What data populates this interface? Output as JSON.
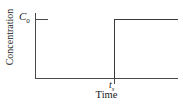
{
  "chart_data": {
    "type": "line",
    "title": "",
    "subtitle": "",
    "xlabel": "Time",
    "ylabel": "Concentration",
    "xlim": [
      0,
      1
    ],
    "ylim": [
      0,
      1.18
    ],
    "grid": false,
    "legend": null,
    "x_tick_labels": [
      "tₛ"
    ],
    "y_tick_labels": [
      "C₀"
    ],
    "series": [
      {
        "name": "Concentration step input",
        "shape": "step",
        "x": [
          0,
          0.552,
          0.552,
          1.0
        ],
        "values": [
          0,
          0,
          1.0,
          1.0
        ]
      }
    ],
    "annotations": [
      {
        "label": "C₀",
        "kind": "y-tick",
        "value": 1.0
      },
      {
        "label": "tₛ",
        "kind": "x-tick",
        "value": 0.552
      }
    ]
  },
  "axes": {
    "y_tick": {
      "symbol": "C",
      "subscript": "0"
    },
    "x_tick": {
      "symbol": "t",
      "subscript": "s"
    },
    "y_title": "Concentration",
    "x_title": "Time"
  },
  "colors": {
    "axis": "#4a4a4a",
    "curve": "#3a3a3a",
    "background": "#ffffff",
    "text": "#1a1a1a"
  }
}
